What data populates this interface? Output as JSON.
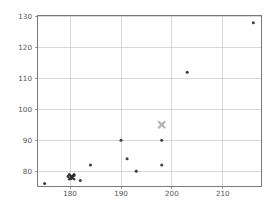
{
  "chart_data": {
    "type": "scatter",
    "title": "",
    "xlabel": "",
    "ylabel": "",
    "xlim": [
      173.5,
      217.5
    ],
    "ylim": [
      75.2,
      130.5
    ],
    "grid": true,
    "legend": "none",
    "xticks": [
      180,
      190,
      200,
      210
    ],
    "yticks": [
      80,
      90,
      100,
      110,
      120,
      130
    ],
    "xtick_labels": [
      "180",
      "190",
      "200",
      "210"
    ],
    "ytick_labels": [
      "80",
      "90",
      "100",
      "110",
      "120",
      "130"
    ],
    "series": [
      {
        "name": "data-points",
        "marker": "circle",
        "color": "#404040",
        "size": 3.1,
        "points": [
          {
            "x": 175.0,
            "y": 76.0
          },
          {
            "x": 179.6,
            "y": 78.3
          },
          {
            "x": 180.2,
            "y": 77.6
          },
          {
            "x": 180.8,
            "y": 78.6
          },
          {
            "x": 182.0,
            "y": 77.0
          },
          {
            "x": 184.0,
            "y": 82.0
          },
          {
            "x": 190.0,
            "y": 90.0
          },
          {
            "x": 191.2,
            "y": 84.0
          },
          {
            "x": 193.0,
            "y": 80.0
          },
          {
            "x": 198.0,
            "y": 90.0
          },
          {
            "x": 198.0,
            "y": 82.0
          },
          {
            "x": 203.0,
            "y": 112.0
          },
          {
            "x": 216.0,
            "y": 128.0
          }
        ]
      },
      {
        "name": "dark-cross-marker",
        "marker": "X",
        "color": "#2b2b2b",
        "size": 6.5,
        "points": [
          {
            "x": 180.3,
            "y": 78.2
          }
        ]
      },
      {
        "name": "gray-cross-marker",
        "marker": "X",
        "color": "#b5b5b5",
        "size": 7.0,
        "points": [
          {
            "x": 198.0,
            "y": 95.0
          }
        ]
      }
    ]
  },
  "axes": {
    "plot_left_px": 37,
    "plot_right_px": 261,
    "plot_top_px": 15,
    "plot_bottom_px": 186
  },
  "colors": {
    "grid": "#c8c8c8",
    "spine": "#7a7a7a",
    "tick_text": "#555555",
    "point": "#404040",
    "cross_dark": "#2b2b2b",
    "cross_light": "#b5b5b5",
    "background": "#ffffff"
  }
}
